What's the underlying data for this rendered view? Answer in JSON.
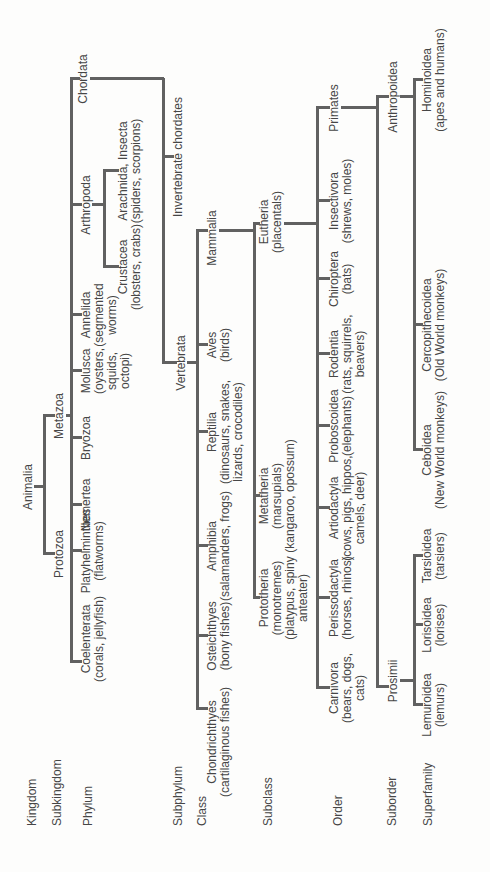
{
  "figure": {
    "type": "taxonomy-tree",
    "orientation": "rotated-90-ccw",
    "background": "#fdfdfc",
    "line_color": "#616161",
    "text_color": "#464646",
    "rank_labels": [
      {
        "id": "kingdom",
        "label": "Kingdom",
        "x": 46,
        "y": 26
      },
      {
        "id": "subkingdom",
        "label": "Subkingdom",
        "x": 46,
        "y": 51
      },
      {
        "id": "phylum",
        "label": "Phylum",
        "x": 46,
        "y": 82
      },
      {
        "id": "subphylum",
        "label": "Subphylum",
        "x": 46,
        "y": 172
      },
      {
        "id": "class",
        "label": "Class",
        "x": 46,
        "y": 196
      },
      {
        "id": "subclass",
        "label": "Subclass",
        "x": 46,
        "y": 262
      },
      {
        "id": "order",
        "label": "Order",
        "x": 46,
        "y": 332
      },
      {
        "id": "suborder",
        "label": "Suborder",
        "x": 46,
        "y": 386
      },
      {
        "id": "superfamily",
        "label": "Superfamily",
        "x": 46,
        "y": 422
      }
    ],
    "nodes": [
      {
        "id": "animalia",
        "rank": "kingdom",
        "lines": [
          "Animalia"
        ],
        "cx": 385,
        "y": 22
      },
      {
        "id": "protozoa",
        "rank": "subkingdom",
        "lines": [
          "Protozoa"
        ],
        "cx": 318,
        "y": 53
      },
      {
        "id": "metazoa",
        "rank": "subkingdom",
        "lines": [
          "Metazoa"
        ],
        "cx": 456,
        "y": 53
      },
      {
        "id": "coelenterata",
        "rank": "phylum",
        "lines": [
          "Coelenterata",
          "(corals, jellyfish)"
        ],
        "cx": 233,
        "y": 80
      },
      {
        "id": "platyhelminthes",
        "rank": "phylum",
        "lines": [
          "Platyhelminthes",
          "(flatworms)"
        ],
        "cx": 321,
        "y": 80
      },
      {
        "id": "nemertea",
        "rank": "phylum",
        "lines": [
          "Nemertea"
        ],
        "cx": 367,
        "y": 80
      },
      {
        "id": "bryozoa",
        "rank": "phylum",
        "lines": [
          "Bryozoa"
        ],
        "cx": 434,
        "y": 80
      },
      {
        "id": "molusca",
        "rank": "phylum",
        "lines": [
          "Molusca",
          "(oysters,",
          "squids,",
          "octopi)"
        ],
        "cx": 501,
        "y": 80
      },
      {
        "id": "annelida",
        "rank": "phylum",
        "lines": [
          "Annelida",
          "(segmented",
          "worms)"
        ],
        "cx": 557,
        "y": 80
      },
      {
        "id": "arthropoda",
        "rank": "phylum",
        "lines": [
          "Arthropoda"
        ],
        "cx": 667,
        "y": 80
      },
      {
        "id": "chordata",
        "rank": "phylum",
        "lines": [
          "Chordata"
        ],
        "cx": 793,
        "y": 77
      },
      {
        "id": "crustacea",
        "rank": "class",
        "lines": [
          "Crustacea",
          "(lobsters, crabs)"
        ],
        "cx": 605,
        "y": 117
      },
      {
        "id": "arachnida",
        "rank": "class",
        "lines": [
          "Arachnida, Insecta",
          "(spiders, scorpions)"
        ],
        "cx": 701,
        "y": 117
      },
      {
        "id": "invert-chordates",
        "rank": "subphylum",
        "lines": [
          "Invertebrate chordates"
        ],
        "cx": 715,
        "y": 172
      },
      {
        "id": "vertebrata",
        "rank": "subphylum",
        "lines": [
          "Vertebrata"
        ],
        "cx": 509,
        "y": 175
      },
      {
        "id": "chondrichthyes",
        "rank": "class",
        "lines": [
          "Chondrichthyes",
          "(cartilaginous fishes)"
        ],
        "cx": 130,
        "y": 206
      },
      {
        "id": "osteichthyes",
        "rank": "class",
        "lines": [
          "Osteichthyes",
          "(bony fishes)"
        ],
        "cx": 236,
        "y": 206
      },
      {
        "id": "amphibia",
        "rank": "class",
        "lines": [
          "Amphibia",
          "(salamanders, frogs)"
        ],
        "cx": 326,
        "y": 206
      },
      {
        "id": "reptilia",
        "rank": "class",
        "lines": [
          "Reptilia",
          "(dinosaurs, snakes,",
          "lizards, crocodiles)"
        ],
        "cx": 440,
        "y": 206
      },
      {
        "id": "aves",
        "rank": "class",
        "lines": [
          "Aves",
          "(birds)"
        ],
        "cx": 527,
        "y": 206
      },
      {
        "id": "mammalia",
        "rank": "class",
        "lines": [
          "Mammalia"
        ],
        "cx": 634,
        "y": 206
      },
      {
        "id": "prototheria",
        "rank": "subclass",
        "lines": [
          "Prototheria",
          "(monotremes)",
          "(platypus, spiny",
          "anteater)"
        ],
        "cx": 274,
        "y": 258
      },
      {
        "id": "metatheria",
        "rank": "subclass",
        "lines": [
          "Metatheria",
          "(marsupials)",
          "(kangaroo, opossum)"
        ],
        "cx": 376,
        "y": 258
      },
      {
        "id": "eutheria",
        "rank": "subclass",
        "lines": [
          "Eutheria",
          "(placentals)"
        ],
        "cx": 650,
        "y": 258
      },
      {
        "id": "carnivora",
        "rank": "order",
        "lines": [
          "Carnivora",
          "(bears, dogs,",
          "cats)"
        ],
        "cx": 184,
        "y": 328
      },
      {
        "id": "perissodactyla",
        "rank": "order",
        "lines": [
          "Perissodactyla",
          "(horses, rhinos)"
        ],
        "cx": 274,
        "y": 328
      },
      {
        "id": "artiodactyla",
        "rank": "order",
        "lines": [
          "Artiodactyla",
          "(cows, pigs, hippos,",
          "camels, deer)"
        ],
        "cx": 364,
        "y": 328
      },
      {
        "id": "proboscoidea",
        "rank": "order",
        "lines": [
          "Proboscoidea",
          "(elephants)"
        ],
        "cx": 446,
        "y": 328
      },
      {
        "id": "rodentia",
        "rank": "order",
        "lines": [
          "Rodentia",
          "(rats, squirrels,",
          "beavers)"
        ],
        "cx": 518,
        "y": 328
      },
      {
        "id": "chiroptera",
        "rank": "order",
        "lines": [
          "Chiroptera",
          "(bats)"
        ],
        "cx": 593,
        "y": 328
      },
      {
        "id": "insectivora",
        "rank": "order",
        "lines": [
          "Insectivora",
          "(shrews, moles)"
        ],
        "cx": 671,
        "y": 328
      },
      {
        "id": "primates",
        "rank": "order",
        "lines": [
          "Primates"
        ],
        "cx": 764,
        "y": 328
      },
      {
        "id": "prosimii",
        "rank": "suborder",
        "lines": [
          "Prosimii"
        ],
        "cx": 191,
        "y": 387
      },
      {
        "id": "anthropoidea",
        "rank": "suborder",
        "lines": [
          "Anthropoidea"
        ],
        "cx": 775,
        "y": 387
      },
      {
        "id": "lemuroidea",
        "rank": "superfamily",
        "lines": [
          "Lemuroidea",
          "(lemurs)"
        ],
        "cx": 167,
        "y": 421
      },
      {
        "id": "lorisoidea",
        "rank": "superfamily",
        "lines": [
          "Lorisoidea",
          "(lorises)"
        ],
        "cx": 247,
        "y": 421
      },
      {
        "id": "tarsioidea",
        "rank": "superfamily",
        "lines": [
          "Tarsioidea",
          "(tarsiers)"
        ],
        "cx": 316,
        "y": 421
      },
      {
        "id": "ceboidea",
        "rank": "superfamily",
        "lines": [
          "Ceboidea",
          "(New World monkeys)"
        ],
        "cx": 422,
        "y": 421
      },
      {
        "id": "cercopithecoidea",
        "rank": "superfamily",
        "lines": [
          "Cercopithecoidea",
          "(Old World monkeys)"
        ],
        "cx": 547,
        "y": 421
      },
      {
        "id": "hominoidea",
        "rank": "superfamily",
        "lines": [
          "Hominoidea",
          "(apes and humans)"
        ],
        "cx": 792,
        "y": 421
      }
    ],
    "connectors": [
      {
        "parent": "animalia",
        "stem": {
          "x": 385,
          "y1": 34,
          "y2": 43
        },
        "bar": {
          "y": 43,
          "x1": 318,
          "x2": 456
        },
        "ticks": [
          {
            "x": 318,
            "y2": 53
          },
          {
            "x": 456,
            "y2": 53
          }
        ]
      },
      {
        "parent": "metazoa",
        "stem": {
          "x": 456,
          "y1": 66,
          "y2": 70
        },
        "bar": {
          "y": 70,
          "x1": 210,
          "x2": 793
        },
        "ticks": [
          {
            "x": 210,
            "y2": 80
          },
          {
            "x": 321,
            "y2": 80
          },
          {
            "x": 367,
            "y2": 80
          },
          {
            "x": 434,
            "y2": 80
          },
          {
            "x": 501,
            "y2": 80
          },
          {
            "x": 557,
            "y2": 80
          },
          {
            "x": 667,
            "y2": 80
          },
          {
            "x": 793,
            "y2": 78
          }
        ]
      },
      {
        "parent": "arthropoda",
        "stem": {
          "x": 667,
          "y1": 92,
          "y2": 103
        },
        "bar": {
          "y": 103,
          "x1": 605,
          "x2": 701
        },
        "ticks": [
          {
            "x": 605,
            "y2": 117
          },
          {
            "x": 701,
            "y2": 117
          }
        ]
      },
      {
        "parent": "chordata",
        "stem": {
          "x": 793,
          "y1": 90,
          "y2": 162
        },
        "bar": {
          "y": 162,
          "x1": 509,
          "x2": 793
        },
        "ticks": [
          {
            "x": 715,
            "y2": 172
          },
          {
            "x": 509,
            "y2": 175
          }
        ]
      },
      {
        "parent": "vertebrata",
        "stem": {
          "x": 509,
          "y1": 187,
          "y2": 196
        },
        "bar": {
          "y": 196,
          "x1": 163,
          "x2": 641
        },
        "ticks": [
          {
            "x": 163,
            "y2": 206
          },
          {
            "x": 236,
            "y2": 206
          },
          {
            "x": 326,
            "y2": 206
          },
          {
            "x": 440,
            "y2": 206
          },
          {
            "x": 527,
            "y2": 206
          },
          {
            "x": 641,
            "y2": 206
          }
        ]
      },
      {
        "parent": "mammalia",
        "stem": {
          "x": 641,
          "y1": 219,
          "y2": 253
        },
        "bar": {
          "y": 253,
          "x1": 274,
          "x2": 648
        },
        "ticks": [
          {
            "x": 274,
            "y2": 258
          },
          {
            "x": 376,
            "y2": 258
          },
          {
            "x": 648,
            "y2": 258
          }
        ]
      },
      {
        "parent": "eutheria",
        "stem": {
          "x": 648,
          "y1": 284,
          "y2": 316
        },
        "bar": {
          "y": 316,
          "x1": 184,
          "x2": 764
        },
        "ticks": [
          {
            "x": 184,
            "y2": 328
          },
          {
            "x": 274,
            "y2": 328
          },
          {
            "x": 364,
            "y2": 328
          },
          {
            "x": 446,
            "y2": 328
          },
          {
            "x": 518,
            "y2": 328
          },
          {
            "x": 593,
            "y2": 328
          },
          {
            "x": 671,
            "y2": 328
          },
          {
            "x": 764,
            "y2": 328
          }
        ]
      },
      {
        "parent": "primates",
        "stem": {
          "x": 764,
          "y1": 341,
          "y2": 376
        },
        "bar": {
          "y": 376,
          "x1": 185,
          "x2": 775
        },
        "ticks": [
          {
            "x": 185,
            "y2": 387
          },
          {
            "x": 775,
            "y2": 387
          }
        ]
      },
      {
        "parent": "prosimii",
        "stem": {
          "x": 191,
          "y1": 400,
          "y2": 413
        },
        "bar": {
          "y": 413,
          "x1": 167,
          "x2": 316
        },
        "ticks": [
          {
            "x": 167,
            "y2": 421
          },
          {
            "x": 247,
            "y2": 421
          },
          {
            "x": 316,
            "y2": 421
          }
        ]
      },
      {
        "parent": "anthropoidea",
        "stem": {
          "x": 775,
          "y1": 400,
          "y2": 413
        },
        "bar": {
          "y": 413,
          "x1": 422,
          "x2": 792
        },
        "ticks": [
          {
            "x": 422,
            "y2": 421
          },
          {
            "x": 547,
            "y2": 421
          },
          {
            "x": 792,
            "y2": 421
          }
        ]
      }
    ]
  }
}
